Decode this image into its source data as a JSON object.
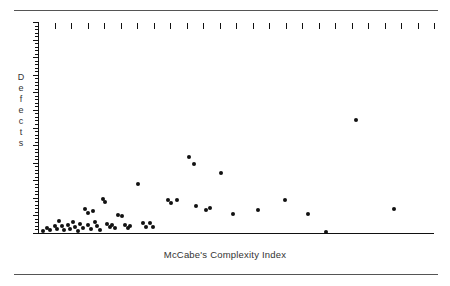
{
  "chart_data": {
    "type": "scatter",
    "title": "",
    "xlabel": "McCabe's Complexity Index",
    "ylabel": "Defects",
    "ylabel_letters": [
      "D",
      "e",
      "f",
      "e",
      "c",
      "t",
      "s"
    ],
    "grid": false,
    "legend": null,
    "axis": {
      "x_tick_count": 24,
      "x_tick_direction": "outward-below",
      "y_minor_tick_count": 60,
      "y_major_every": 5,
      "x_tick_labels": [],
      "y_tick_labels": [],
      "xlim": [
        0,
        24
      ],
      "ylim": [
        0,
        60
      ]
    },
    "marker": {
      "shape": "circle",
      "color": "#111111",
      "size_px": 4
    },
    "points": [
      {
        "x": 0.28,
        "y": 0.6
      },
      {
        "x": 0.55,
        "y": 1.5
      },
      {
        "x": 0.75,
        "y": 0.9
      },
      {
        "x": 1.05,
        "y": 2.1
      },
      {
        "x": 1.15,
        "y": 1.2
      },
      {
        "x": 1.3,
        "y": 3.4
      },
      {
        "x": 1.45,
        "y": 2.0
      },
      {
        "x": 1.6,
        "y": 0.8
      },
      {
        "x": 1.8,
        "y": 2.3
      },
      {
        "x": 1.95,
        "y": 1.0
      },
      {
        "x": 2.1,
        "y": 3.2
      },
      {
        "x": 2.25,
        "y": 1.8
      },
      {
        "x": 2.4,
        "y": 0.7
      },
      {
        "x": 2.55,
        "y": 2.6
      },
      {
        "x": 2.7,
        "y": 1.4
      },
      {
        "x": 2.85,
        "y": 6.8
      },
      {
        "x": 3.0,
        "y": 5.6
      },
      {
        "x": 3.05,
        "y": 2.2
      },
      {
        "x": 3.2,
        "y": 1.1
      },
      {
        "x": 3.35,
        "y": 6.3
      },
      {
        "x": 3.45,
        "y": 3.0
      },
      {
        "x": 3.6,
        "y": 1.9
      },
      {
        "x": 3.75,
        "y": 0.9
      },
      {
        "x": 3.95,
        "y": 9.6
      },
      {
        "x": 4.05,
        "y": 8.7
      },
      {
        "x": 4.2,
        "y": 2.6
      },
      {
        "x": 4.35,
        "y": 1.6
      },
      {
        "x": 4.5,
        "y": 2.4
      },
      {
        "x": 4.65,
        "y": 1.5
      },
      {
        "x": 4.85,
        "y": 5.2
      },
      {
        "x": 5.1,
        "y": 4.9
      },
      {
        "x": 5.3,
        "y": 2.3
      },
      {
        "x": 5.45,
        "y": 1.4
      },
      {
        "x": 5.6,
        "y": 2.1
      },
      {
        "x": 6.05,
        "y": 13.8
      },
      {
        "x": 6.35,
        "y": 2.9
      },
      {
        "x": 6.55,
        "y": 1.7
      },
      {
        "x": 6.8,
        "y": 2.8
      },
      {
        "x": 6.95,
        "y": 1.6
      },
      {
        "x": 7.9,
        "y": 9.4
      },
      {
        "x": 8.05,
        "y": 8.6
      },
      {
        "x": 8.45,
        "y": 9.5
      },
      {
        "x": 9.15,
        "y": 21.5
      },
      {
        "x": 9.45,
        "y": 19.6
      },
      {
        "x": 9.55,
        "y": 7.6
      },
      {
        "x": 10.2,
        "y": 6.4
      },
      {
        "x": 10.45,
        "y": 7.0
      },
      {
        "x": 11.1,
        "y": 17.2
      },
      {
        "x": 11.8,
        "y": 5.3
      },
      {
        "x": 13.35,
        "y": 6.6
      },
      {
        "x": 14.95,
        "y": 9.5
      },
      {
        "x": 16.35,
        "y": 5.4
      },
      {
        "x": 17.45,
        "y": 0.3
      },
      {
        "x": 19.3,
        "y": 32.0
      },
      {
        "x": 21.55,
        "y": 6.8
      }
    ]
  }
}
